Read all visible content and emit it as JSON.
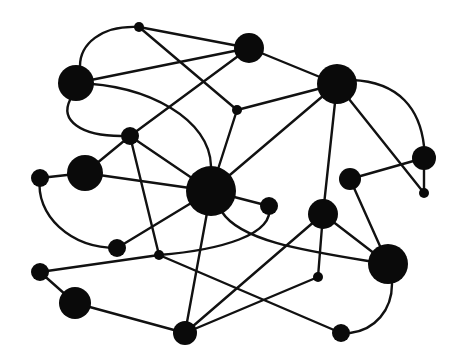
{
  "diagram": {
    "type": "network-graph",
    "background": "#ffffff",
    "node_color": "#0a0a0a",
    "edge_color": "#111111",
    "nodes": [
      {
        "id": "n1",
        "x": 139,
        "y": 27,
        "r": 5
      },
      {
        "id": "n2",
        "x": 249,
        "y": 48,
        "r": 15
      },
      {
        "id": "n3",
        "x": 76,
        "y": 83,
        "r": 18
      },
      {
        "id": "n4",
        "x": 337,
        "y": 84,
        "r": 20
      },
      {
        "id": "n5",
        "x": 237,
        "y": 110,
        "r": 5
      },
      {
        "id": "n6",
        "x": 130,
        "y": 136,
        "r": 9
      },
      {
        "id": "n7",
        "x": 85,
        "y": 173,
        "r": 18
      },
      {
        "id": "n8",
        "x": 40,
        "y": 178,
        "r": 9
      },
      {
        "id": "n9",
        "x": 211,
        "y": 191,
        "r": 25
      },
      {
        "id": "n10",
        "x": 350,
        "y": 179,
        "r": 11
      },
      {
        "id": "n11",
        "x": 424,
        "y": 158,
        "r": 12
      },
      {
        "id": "n12",
        "x": 424,
        "y": 193,
        "r": 5
      },
      {
        "id": "n13",
        "x": 269,
        "y": 206,
        "r": 9
      },
      {
        "id": "n14",
        "x": 323,
        "y": 214,
        "r": 15
      },
      {
        "id": "n15",
        "x": 117,
        "y": 248,
        "r": 9
      },
      {
        "id": "n16",
        "x": 159,
        "y": 255,
        "r": 5
      },
      {
        "id": "n17",
        "x": 40,
        "y": 272,
        "r": 9
      },
      {
        "id": "n18",
        "x": 388,
        "y": 264,
        "r": 20
      },
      {
        "id": "n19",
        "x": 318,
        "y": 277,
        "r": 5
      },
      {
        "id": "n20",
        "x": 75,
        "y": 303,
        "r": 16
      },
      {
        "id": "n21",
        "x": 185,
        "y": 333,
        "r": 12
      },
      {
        "id": "n22",
        "x": 341,
        "y": 333,
        "r": 9
      }
    ],
    "edges": [
      {
        "d": "M139,27 L249,48"
      },
      {
        "d": "M139,27 L237,110"
      },
      {
        "d": "M139,27 C100,25 80,45 80,66"
      },
      {
        "d": "M76,83 L249,48"
      },
      {
        "d": "M76,83 C150,85 210,120 211,166"
      },
      {
        "d": "M70,100 C60,120 80,136 121,136"
      },
      {
        "d": "M249,48 L337,84"
      },
      {
        "d": "M130,136 L249,48"
      },
      {
        "d": "M237,110 L337,84"
      },
      {
        "d": "M237,110 L211,191"
      },
      {
        "d": "M130,136 L211,191"
      },
      {
        "d": "M130,136 L159,255"
      },
      {
        "d": "M130,136 L85,173"
      },
      {
        "d": "M40,178 L85,173"
      },
      {
        "d": "M85,173 L211,191"
      },
      {
        "d": "M40,178 C35,215 70,248 117,248"
      },
      {
        "d": "M117,248 L211,191"
      },
      {
        "d": "M211,191 L337,84"
      },
      {
        "d": "M211,191 L269,206"
      },
      {
        "d": "M211,191 L185,333"
      },
      {
        "d": "M222,212 C240,240 300,250 368,261"
      },
      {
        "d": "M269,206 C275,235 220,250 159,255"
      },
      {
        "d": "M337,84 L323,214"
      },
      {
        "d": "M337,84 L424,193"
      },
      {
        "d": "M352,80 C400,82 420,110 424,146"
      },
      {
        "d": "M424,158 L424,193"
      },
      {
        "d": "M350,179 L424,158"
      },
      {
        "d": "M350,179 L388,264"
      },
      {
        "d": "M323,214 L388,264"
      },
      {
        "d": "M323,214 L318,277"
      },
      {
        "d": "M323,214 L185,333"
      },
      {
        "d": "M318,277 L185,333"
      },
      {
        "d": "M40,272 L159,255"
      },
      {
        "d": "M159,255 L341,333"
      },
      {
        "d": "M40,272 L75,303"
      },
      {
        "d": "M75,303 L185,333"
      },
      {
        "d": "M392,284 C392,310 375,330 350,333"
      }
    ]
  }
}
